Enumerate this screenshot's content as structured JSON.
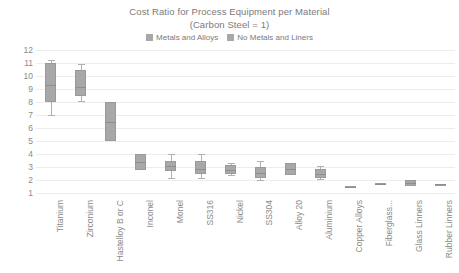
{
  "chart_data": {
    "type": "box",
    "title": "Cost Ratio for Process Equipment per Material",
    "subtitle": "(Carbon Steel = 1)",
    "xlabel": "",
    "ylabel": "",
    "ylim": [
      0.5,
      12
    ],
    "yticks": [
      12,
      11,
      10,
      9,
      8,
      7,
      6,
      5,
      4,
      3,
      2,
      1
    ],
    "grid": true,
    "legend_position": "top-center",
    "legend": [
      {
        "label": "Metals and Alloys",
        "color": "#a8a8a8"
      },
      {
        "label": "No Metals and Liners",
        "color": "#a8a8a8"
      }
    ],
    "categories": [
      "Titanium",
      "Zirconium",
      "Hastelloy B or C",
      "Inconel",
      "Monel",
      "SS316",
      "Nickel",
      "SS304",
      "Alloy 20",
      "Aluminium",
      "Copper Alloys",
      "Fiberglass...",
      "Glass Linners",
      "Rubber Linners"
    ],
    "boxes": [
      {
        "category": "Titanium",
        "series": "Metals and Alloys",
        "low": 7.0,
        "q1": 8.0,
        "median": 9.3,
        "q3": 11.0,
        "high": 11.2
      },
      {
        "category": "Zirconium",
        "series": "Metals and Alloys",
        "low": 8.1,
        "q1": 8.5,
        "median": 9.2,
        "q3": 10.5,
        "high": 10.9
      },
      {
        "category": "Hastelloy B or C",
        "series": "Metals and Alloys",
        "low": 5.0,
        "q1": 5.0,
        "median": 6.5,
        "q3": 8.0,
        "high": 8.0
      },
      {
        "category": "Inconel",
        "series": "Metals and Alloys",
        "low": 2.8,
        "q1": 2.8,
        "median": 3.4,
        "q3": 4.0,
        "high": 4.0
      },
      {
        "category": "Monel",
        "series": "Metals and Alloys",
        "low": 2.2,
        "q1": 2.7,
        "median": 3.1,
        "q3": 3.5,
        "high": 4.0
      },
      {
        "category": "SS316",
        "series": "Metals and Alloys",
        "low": 2.2,
        "q1": 2.5,
        "median": 2.9,
        "q3": 3.5,
        "high": 4.0
      },
      {
        "category": "Nickel",
        "series": "Metals and Alloys",
        "low": 2.4,
        "q1": 2.5,
        "median": 2.8,
        "q3": 3.2,
        "high": 3.3
      },
      {
        "category": "SS304",
        "series": "Metals and Alloys",
        "low": 2.0,
        "q1": 2.2,
        "median": 2.6,
        "q3": 3.0,
        "high": 3.5
      },
      {
        "category": "Alloy 20",
        "series": "Metals and Alloys",
        "low": 2.4,
        "q1": 2.4,
        "median": 2.9,
        "q3": 3.3,
        "high": 3.3
      },
      {
        "category": "Aluminium",
        "series": "Metals and Alloys",
        "low": 2.1,
        "q1": 2.2,
        "median": 2.5,
        "q3": 2.9,
        "high": 3.1
      },
      {
        "category": "Copper Alloys",
        "series": "Metals and Alloys",
        "low": 1.4,
        "q1": 1.4,
        "median": 1.5,
        "q3": 1.6,
        "high": 1.6
      },
      {
        "category": "Fiberglass...",
        "series": "No Metals and Liners",
        "low": 1.7,
        "q1": 1.7,
        "median": 1.75,
        "q3": 1.8,
        "high": 1.8
      },
      {
        "category": "Glass Linners",
        "series": "No Metals and Liners",
        "low": 1.6,
        "q1": 1.6,
        "median": 1.8,
        "q3": 2.0,
        "high": 2.0
      },
      {
        "category": "Rubber Linners",
        "series": "No Metals and Liners",
        "low": 1.65,
        "q1": 1.65,
        "median": 1.7,
        "q3": 1.75,
        "high": 1.75
      }
    ]
  }
}
